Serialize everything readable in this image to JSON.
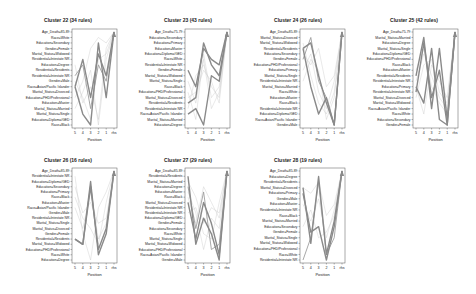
{
  "chart_data": [
    {
      "type": "line",
      "title": "Cluster 22 (34 rules)",
      "xlabel": "Position",
      "x": [
        "5",
        "4",
        "3",
        "2",
        "1",
        "rhs"
      ],
      "ylabels": [
        "Age_Death=85-89",
        "Race=White",
        "Education=Secondary",
        "Gender=Female",
        "Marital_Status=Widowed",
        "Residential=Intestate NR",
        "Education=Degree",
        "Residential=Residents",
        "Residential=Intestate NR",
        "Gender=Male",
        "Race=Asian/Pacific Islander",
        "Marital_Status=Divorced",
        "Education=PHD/Professional",
        "Education=Master",
        "Marital_Status=Married",
        "Marital_Status=Single",
        "Education=Diploma/GED",
        "Race=Black"
      ],
      "series": [
        {
          "name": "main-1",
          "weight": "heavy",
          "values": [
            10,
            15,
            17,
            2,
            12,
            0
          ]
        },
        {
          "name": "main-2",
          "weight": "heavy",
          "values": [
            10,
            5,
            12,
            4,
            8,
            0
          ]
        },
        {
          "name": "main-3",
          "weight": "medium",
          "values": [
            8,
            6,
            14,
            6,
            9,
            0
          ]
        },
        {
          "name": "light-1",
          "weight": "light",
          "values": [
            12,
            9,
            3,
            1,
            2,
            0
          ]
        },
        {
          "name": "light-2",
          "weight": "light",
          "values": [
            14,
            11,
            7,
            17,
            5,
            0
          ]
        },
        {
          "name": "light-3",
          "weight": "light",
          "values": [
            6,
            13,
            10,
            16,
            3,
            0
          ]
        },
        {
          "name": "light-4",
          "weight": "light",
          "values": [
            9,
            12,
            16,
            5,
            4,
            0
          ]
        }
      ]
    },
    {
      "type": "line",
      "title": "Cluster 23 (43 rules)",
      "xlabel": "Position",
      "x": [
        "5",
        "4",
        "3",
        "2",
        "1",
        "rhs"
      ],
      "ylabels": [
        "Age_Death=75-79",
        "Education=Secondary",
        "Education=Primary",
        "Education=Master",
        "Education=Diploma/GED",
        "Race=White",
        "Residential=Intestate NR",
        "Gender=Female",
        "Marital_Status=Widowed",
        "Marital_Status=Single",
        "Race=Black",
        "Education=PHD/Professional",
        "Marital_Status=Divorced",
        "Residential=Residents",
        "Residential=Intestate NR",
        "Race=Asian/Pacific Islander",
        "Marital_Status=Married",
        "Education=Degree"
      ],
      "series": [
        {
          "name": "main-1",
          "weight": "heavy",
          "values": [
            13,
            12,
            2,
            6,
            8,
            0
          ]
        },
        {
          "name": "main-2",
          "weight": "heavy",
          "values": [
            7,
            10,
            3,
            5,
            6,
            0
          ]
        },
        {
          "name": "main-3",
          "weight": "heavy",
          "values": [
            15,
            14,
            17,
            8,
            9,
            0
          ]
        },
        {
          "name": "light-1",
          "weight": "light",
          "values": [
            11,
            16,
            4,
            12,
            10,
            0
          ]
        },
        {
          "name": "light-2",
          "weight": "light",
          "values": [
            9,
            13,
            5,
            14,
            11,
            0
          ]
        },
        {
          "name": "light-3",
          "weight": "light",
          "values": [
            14,
            8,
            6,
            10,
            12,
            0
          ]
        },
        {
          "name": "light-4",
          "weight": "light",
          "values": [
            12,
            11,
            7,
            9,
            13,
            0
          ]
        }
      ]
    },
    {
      "type": "line",
      "title": "Cluster 24 (26 rules)",
      "xlabel": "Position",
      "x": [
        "5",
        "4",
        "3",
        "2",
        "1",
        "rhs"
      ],
      "ylabels": [
        "Age_Death=85-89",
        "Marital_Status=Divorced",
        "Marital_Status=Widowed",
        "Residential=Residents",
        "Education=Secondary",
        "Gender=Female",
        "Education=PHD/Professional",
        "Education=Primary",
        "Marital_Status=Single",
        "Residential=Intestate NR",
        "Marital_Status=Married",
        "Race=White",
        "Education=Master",
        "Race=Black",
        "Residential=Intestate NR",
        "Education=Diploma/GED",
        "Race=Asian/Pacific Islander",
        "Gender=Male"
      ],
      "series": [
        {
          "name": "main-1",
          "weight": "heavy",
          "values": [
            3,
            10,
            15,
            12,
            17,
            0
          ]
        },
        {
          "name": "main-2",
          "weight": "heavy",
          "values": [
            3,
            2,
            8,
            13,
            17,
            0
          ]
        },
        {
          "name": "main-3",
          "weight": "medium",
          "values": [
            5,
            1,
            9,
            12,
            17,
            0
          ]
        },
        {
          "name": "light-1",
          "weight": "light",
          "values": [
            4,
            6,
            3,
            10,
            8,
            0
          ]
        },
        {
          "name": "light-2",
          "weight": "light",
          "values": [
            7,
            4,
            11,
            14,
            9,
            0
          ]
        },
        {
          "name": "light-3",
          "weight": "light",
          "values": [
            9,
            5,
            7,
            16,
            12,
            0
          ]
        },
        {
          "name": "light-4",
          "weight": "light",
          "values": [
            2,
            8,
            13,
            15,
            11,
            0
          ]
        }
      ]
    },
    {
      "type": "line",
      "title": "Cluster 25 (42 rules)",
      "xlabel": "Position",
      "x": [
        "5",
        "4",
        "3",
        "2",
        "1",
        "rhs"
      ],
      "ylabels": [
        "Age_Death=75-79",
        "Marital_Status=Married",
        "Education=Degree",
        "Marital_Status=Single",
        "Education=Diploma/GED",
        "Education=PHD/Professional",
        "Race=Black",
        "Education=Master",
        "Residential=Residents",
        "Residential=Intestate NR",
        "Education=Primary",
        "Residential=Intestate NR",
        "Marital_Status=Divorced",
        "Marital_Status=Widowed",
        "Race=Asian/Pacific Islander",
        "Race=White",
        "Education=Secondary",
        "Gender=Female"
      ],
      "series": [
        {
          "name": "main-1",
          "weight": "heavy",
          "values": [
            8,
            1,
            14,
            3,
            16,
            0
          ]
        },
        {
          "name": "main-2",
          "weight": "heavy",
          "values": [
            10,
            13,
            3,
            16,
            17,
            0
          ]
        },
        {
          "name": "main-3",
          "weight": "heavy",
          "values": [
            11,
            2,
            12,
            7,
            17,
            0
          ]
        },
        {
          "name": "light-1",
          "weight": "light",
          "values": [
            9,
            4,
            8,
            12,
            14,
            0
          ]
        },
        {
          "name": "light-2",
          "weight": "light",
          "values": [
            7,
            3,
            10,
            13,
            15,
            0
          ]
        },
        {
          "name": "light-3",
          "weight": "light",
          "values": [
            12,
            6,
            5,
            11,
            13,
            0
          ]
        },
        {
          "name": "light-4",
          "weight": "light",
          "values": [
            10,
            15,
            6,
            9,
            12,
            0
          ]
        }
      ]
    },
    {
      "type": "line",
      "title": "Cluster 26 (16 rules)",
      "xlabel": "Position",
      "x": [
        "5",
        "4",
        "3",
        "2",
        "1",
        "rhs"
      ],
      "ylabels": [
        "Age_Death=85-89",
        "Residential=Intestate NR",
        "Education=Diploma/GED",
        "Education=Secondary",
        "Education=Primary",
        "Race=Black",
        "Education=Master",
        "Race=Asian/Pacific Islander",
        "Gender=Male",
        "Residential=Intestate NR",
        "Marital_Status=Single",
        "Marital_Status=Divorced",
        "Gender=Female",
        "Residential=Residents",
        "Marital_Status=Widowed",
        "Education=PHD/Professional",
        "Race=White",
        "Education=Degree"
      ],
      "series": [
        {
          "name": "main-1",
          "weight": "heavy",
          "values": [
            13,
            14,
            2,
            16,
            12,
            0
          ]
        },
        {
          "name": "main-2",
          "weight": "heavy",
          "values": [
            13,
            14,
            3,
            15,
            11,
            0
          ]
        },
        {
          "name": "light-1",
          "weight": "light",
          "values": [
            1,
            12,
            17,
            7,
            4,
            0
          ]
        },
        {
          "name": "light-2",
          "weight": "light",
          "values": [
            5,
            9,
            11,
            14,
            6,
            0
          ]
        },
        {
          "name": "light-3",
          "weight": "light",
          "values": [
            3,
            8,
            6,
            10,
            9,
            0
          ]
        },
        {
          "name": "light-4",
          "weight": "light",
          "values": [
            7,
            11,
            4,
            13,
            10,
            0
          ]
        }
      ]
    },
    {
      "type": "line",
      "title": "Cluster 27 (29 rules)",
      "xlabel": "Position",
      "x": [
        "5",
        "4",
        "3",
        "2",
        "1",
        "rhs"
      ],
      "ylabels": [
        "Age_Death=85-89",
        "Residential=Residents",
        "Marital_Status=Married",
        "Education=Degree",
        "Education=Master",
        "Race=Black",
        "Marital_Status=Divorced",
        "Residential=Intestate NR",
        "Residential=Intestate NR",
        "Education=Diploma/GED",
        "Gender=Female",
        "Education=Secondary",
        "Race=White",
        "Marital_Status=Single",
        "Marital_Status=Widowed",
        "Education=PHD/Professional",
        "Race=Asian/Pacific Islander",
        "Gender=Male"
      ],
      "series": [
        {
          "name": "main-1",
          "weight": "heavy",
          "values": [
            1,
            14,
            9,
            12,
            17,
            0
          ]
        },
        {
          "name": "main-2",
          "weight": "heavy",
          "values": [
            6,
            13,
            6,
            10,
            16,
            0
          ]
        },
        {
          "name": "main-3",
          "weight": "medium",
          "values": [
            3,
            11,
            4,
            15,
            14,
            0
          ]
        },
        {
          "name": "light-1",
          "weight": "light",
          "values": [
            2,
            5,
            10,
            7,
            8,
            0
          ]
        },
        {
          "name": "light-2",
          "weight": "light",
          "values": [
            4,
            8,
            15,
            9,
            11,
            0
          ]
        },
        {
          "name": "light-3",
          "weight": "light",
          "values": [
            8,
            7,
            12,
            13,
            6,
            0
          ]
        },
        {
          "name": "light-4",
          "weight": "light",
          "values": [
            5,
            10,
            3,
            6,
            9,
            0
          ]
        }
      ]
    },
    {
      "type": "line",
      "title": "Cluster 28 (19 rules)",
      "xlabel": "Position",
      "x": [
        "5",
        "4",
        "3",
        "2",
        "1",
        "rhs"
      ],
      "ylabels": [
        "Age_Death=85-89",
        "Education=Degree",
        "Residential=Residents",
        "Marital_Status=Divorced",
        "Education=Primary",
        "Gender=Male",
        "Education=Master",
        "Residential=Intestate NR",
        "Race=Black",
        "Marital_Status=Married",
        "Education=Secondary",
        "Gender=Female",
        "Marital_Status=Single",
        "Marital_Status=Widowed",
        "Education=PHD/Professional",
        "Race=White",
        "Residential=Intestate NR"
      ],
      "series": [
        {
          "name": "main-1",
          "weight": "heavy",
          "values": [
            3,
            13,
            1,
            15,
            9,
            0
          ]
        },
        {
          "name": "main-2",
          "weight": "heavy",
          "values": [
            4,
            11,
            10,
            16,
            10,
            0
          ]
        },
        {
          "name": "main-3",
          "weight": "medium",
          "values": [
            16,
            12,
            2,
            15,
            12,
            0
          ]
        },
        {
          "name": "light-1",
          "weight": "light",
          "values": [
            3,
            4,
            2,
            8,
            6,
            0
          ]
        },
        {
          "name": "light-2",
          "weight": "light",
          "values": [
            6,
            9,
            5,
            12,
            7,
            0
          ]
        },
        {
          "name": "light-3",
          "weight": "light",
          "values": [
            10,
            7,
            12,
            11,
            8,
            0
          ]
        }
      ]
    }
  ],
  "layout": {
    "panels": [
      {
        "plot": [
          72,
          29,
          45,
          99
        ],
        "title_x": 68,
        "title_y": 22
      },
      {
        "plot": [
          185,
          29,
          45,
          99
        ],
        "title_x": 188,
        "title_y": 22
      },
      {
        "plot": [
          300,
          29,
          45,
          99
        ],
        "title_x": 298,
        "title_y": 22
      },
      {
        "plot": [
          413,
          29,
          45,
          99
        ],
        "title_x": 414,
        "title_y": 22
      },
      {
        "plot": [
          72,
          168,
          45,
          95
        ],
        "title_x": 68,
        "title_y": 162
      },
      {
        "plot": [
          185,
          168,
          45,
          95
        ],
        "title_x": 188,
        "title_y": 162
      },
      {
        "plot": [
          300,
          168,
          45,
          95
        ],
        "title_x": 298,
        "title_y": 162
      }
    ],
    "colors": {
      "heavy": "#8a8a8a",
      "medium": "#9e9e9e",
      "light": "#c8c8c8",
      "axis": "#444444",
      "frame": "#555555"
    }
  }
}
